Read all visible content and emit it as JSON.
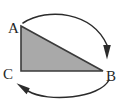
{
  "diagram": {
    "background_color": "#ffffff",
    "triangle": {
      "name": "triangle-ABC",
      "fill_color": "#a9a9a9",
      "stroke_color": "#3b3b3b",
      "stroke_width": 1.6,
      "vertices": [
        {
          "label": "A",
          "x": 21,
          "y": 26
        },
        {
          "label": "B",
          "x": 103,
          "y": 71
        },
        {
          "label": "C",
          "x": 21,
          "y": 71
        }
      ],
      "points_path": "21,26 103,71 21,71"
    },
    "labels": [
      {
        "name": "vertex-label-a",
        "text": "A",
        "x": 8,
        "y": 33,
        "anchor": "start"
      },
      {
        "name": "vertex-label-b",
        "text": "B",
        "x": 106,
        "y": 81,
        "anchor": "start"
      },
      {
        "name": "vertex-label-c",
        "text": "C",
        "x": 4,
        "y": 79,
        "anchor": "start"
      }
    ],
    "arrows": [
      {
        "name": "arc-arrow-top",
        "description": "curved arrow from A over the top to B",
        "path": "M 23,23 C 48,7 92,12 107,45",
        "arrowhead": {
          "tip_x": 107,
          "tip_y": 59,
          "direction": "down"
        },
        "stroke_color": "#2b2b2b",
        "stroke_width": 1.5
      },
      {
        "name": "arc-arrow-bottom",
        "description": "curved arrow from B under the bottom to C",
        "path": "M 109,80 C 100,98 48,103 28,91",
        "arrowhead": {
          "tip_x": 17,
          "tip_y": 84,
          "direction": "up-left"
        },
        "stroke_color": "#2b2b2b",
        "stroke_width": 1.5
      }
    ]
  }
}
